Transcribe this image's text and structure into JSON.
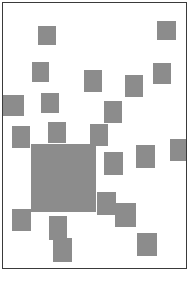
{
  "canvas": {
    "width": 195,
    "height": 281,
    "background_color": "#ffffff",
    "description": "scatter of gray squares on white framed panel"
  },
  "panel": {
    "x": 2,
    "y": 2,
    "width": 185,
    "height": 267,
    "border_color": "#3a3a3a",
    "border_width": 1.5,
    "background_color": "#ffffff"
  },
  "shape_style": {
    "fill_color": "#8c8c8c",
    "stroke_color": "#8c8c8c",
    "stroke_width": 0
  },
  "shapes": [
    {
      "name": "square-1",
      "x": 38,
      "y": 26,
      "w": 18,
      "h": 19
    },
    {
      "name": "square-2",
      "x": 157,
      "y": 21,
      "w": 19,
      "h": 19
    },
    {
      "name": "square-3",
      "x": 32,
      "y": 62,
      "w": 17,
      "h": 20
    },
    {
      "name": "square-4",
      "x": 84,
      "y": 70,
      "w": 18,
      "h": 22
    },
    {
      "name": "square-5",
      "x": 153,
      "y": 63,
      "w": 18,
      "h": 21
    },
    {
      "name": "square-6",
      "x": 125,
      "y": 75,
      "w": 18,
      "h": 22
    },
    {
      "name": "square-7",
      "x": 41,
      "y": 93,
      "w": 18,
      "h": 20
    },
    {
      "name": "square-8",
      "x": 0,
      "y": 95,
      "w": 24,
      "h": 21
    },
    {
      "name": "square-9",
      "x": 104,
      "y": 101,
      "w": 18,
      "h": 22
    },
    {
      "name": "square-10",
      "x": 48,
      "y": 122,
      "w": 18,
      "h": 21
    },
    {
      "name": "square-11",
      "x": 90,
      "y": 124,
      "w": 18,
      "h": 22
    },
    {
      "name": "square-12",
      "x": 12,
      "y": 126,
      "w": 18,
      "h": 22
    },
    {
      "name": "square-13",
      "x": 170,
      "y": 139,
      "w": 25,
      "h": 22
    },
    {
      "name": "square-big",
      "x": 31,
      "y": 144,
      "w": 65,
      "h": 68
    },
    {
      "name": "square-14",
      "x": 104,
      "y": 152,
      "w": 19,
      "h": 23
    },
    {
      "name": "square-15",
      "x": 136,
      "y": 145,
      "w": 19,
      "h": 23
    },
    {
      "name": "square-16",
      "x": 97,
      "y": 192,
      "w": 19,
      "h": 23
    },
    {
      "name": "square-17",
      "x": 115,
      "y": 203,
      "w": 21,
      "h": 24
    },
    {
      "name": "square-18",
      "x": 12,
      "y": 209,
      "w": 19,
      "h": 22
    },
    {
      "name": "square-19",
      "x": 49,
      "y": 216,
      "w": 18,
      "h": 24
    },
    {
      "name": "square-20",
      "x": 137,
      "y": 233,
      "w": 20,
      "h": 23
    },
    {
      "name": "square-21",
      "x": 53,
      "y": 238,
      "w": 19,
      "h": 24
    }
  ]
}
